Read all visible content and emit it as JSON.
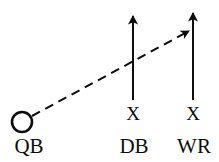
{
  "diagram": {
    "type": "football-play",
    "canvas": {
      "width": 219,
      "height": 162
    },
    "background_color": "#ffffff",
    "ink_color": "#0d0d0d",
    "players": [
      {
        "id": "qb",
        "role_label": "QB",
        "marker": "circle",
        "label_x": 29,
        "label_y": 146,
        "marker_cx": 22,
        "marker_cy": 122,
        "marker_r": 10
      },
      {
        "id": "db",
        "role_label": "DB",
        "marker": "X",
        "marker_label": "X",
        "marker_x": 133,
        "marker_y": 113,
        "label_x": 134,
        "label_y": 146
      },
      {
        "id": "wr",
        "role_label": "WR",
        "marker": "X",
        "marker_label": "X",
        "marker_x": 193,
        "marker_y": 113,
        "label_x": 194,
        "label_y": 146
      }
    ],
    "routes": [
      {
        "id": "db-route",
        "owner": "db",
        "style": "solid",
        "description": "DB vertical route upfield",
        "from_x": 133,
        "from_y": 100,
        "to_x": 133,
        "to_y": 16,
        "arrowhead": true,
        "stroke_width": 2
      },
      {
        "id": "wr-route",
        "owner": "wr",
        "style": "solid",
        "description": "WR vertical go route upfield",
        "from_x": 193,
        "from_y": 100,
        "to_x": 193,
        "to_y": 13,
        "arrowhead": true,
        "stroke_width": 2
      },
      {
        "id": "pass-path",
        "owner": "qb",
        "style": "dashed",
        "description": "Dashed pass trajectory from QB to WR",
        "from_x": 32,
        "from_y": 116,
        "to_x": 189,
        "to_y": 31,
        "arrowhead": true,
        "stroke_width": 2,
        "dash_pattern": "9 6"
      }
    ]
  }
}
